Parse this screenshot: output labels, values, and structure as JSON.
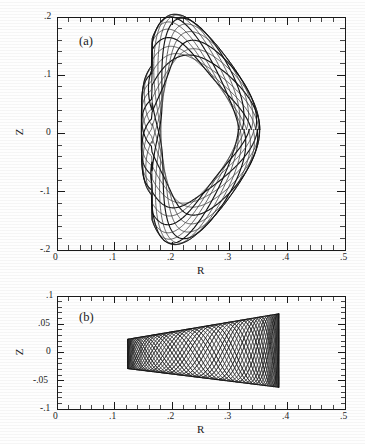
{
  "figure": {
    "type": "scientific-figure",
    "background_color": "#fefefe",
    "line_color": "#1a1a1a"
  },
  "panels": [
    {
      "tag": "(a)",
      "xlabel": "R",
      "ylabel": "Z",
      "xlim": [
        0,
        0.5
      ],
      "ylim": [
        -0.2,
        0.2
      ],
      "xticks": [
        "0",
        ".1",
        ".2",
        ".3",
        ".4",
        ".5"
      ],
      "xtick_values": [
        0,
        0.1,
        0.2,
        0.3,
        0.4,
        0.5
      ],
      "yticks": [
        ".2",
        ".1",
        "0",
        "-.1",
        "-.2"
      ],
      "ytick_values": [
        0.2,
        0.1,
        0,
        -0.1,
        -0.2
      ],
      "xminor_per_major": 5,
      "yminor_per_major": 5,
      "grid": false
    },
    {
      "tag": "(b)",
      "xlabel": "R",
      "ylabel": "Z",
      "xlim": [
        0,
        0.5
      ],
      "ylim": [
        -0.1,
        0.1
      ],
      "xticks": [
        "0",
        ".1",
        ".2",
        ".3",
        ".4",
        ".5"
      ],
      "xtick_values": [
        0,
        0.1,
        0.2,
        0.3,
        0.4,
        0.5
      ],
      "yticks": [
        ".1",
        ".05",
        "0",
        "-.05",
        "-.1"
      ],
      "ytick_values": [
        0.1,
        0.05,
        0,
        -0.05,
        -0.1
      ],
      "xminor_per_major": 5,
      "yminor_per_major": 5,
      "grid": false
    }
  ],
  "chart_data": {
    "type": "line",
    "title": "",
    "xlabel": "R",
    "ylabel": "Z",
    "subplots": [
      {
        "tag": "(a)",
        "xlim": [
          0,
          0.5
        ],
        "ylim": [
          -0.2,
          0.2
        ],
        "xlabel": "R",
        "ylabel": "Z",
        "xticks": [
          0,
          0.1,
          0.2,
          0.3,
          0.4,
          0.5
        ],
        "xticklabels": [
          "0",
          ".1",
          ".2",
          ".3",
          ".4",
          ".5"
        ],
        "yticks": [
          -0.2,
          -0.1,
          0,
          0.1,
          0.2
        ],
        "yticklabels": [
          "-.2",
          "-.1",
          "0",
          ".1",
          ".2"
        ],
        "surface": {
          "shape": "bean-triangular flux surface traced by helical field lines",
          "R_min": 0.143,
          "R_max": 0.352,
          "Z_min": -0.163,
          "Z_max": 0.178,
          "R_center": 0.248,
          "Z_center": 0.007,
          "n_field_line_traces": 14,
          "boundary_R": [
            0.143,
            0.15,
            0.175,
            0.215,
            0.262,
            0.3,
            0.33,
            0.348,
            0.352,
            0.345,
            0.328,
            0.305,
            0.282,
            0.255,
            0.222,
            0.188,
            0.16,
            0.145,
            0.143
          ],
          "boundary_Z": [
            0.098,
            0.135,
            0.163,
            0.176,
            0.172,
            0.152,
            0.118,
            0.07,
            0.01,
            -0.05,
            -0.1,
            -0.14,
            -0.16,
            -0.163,
            -0.148,
            -0.122,
            -0.1,
            -0.094,
            0.098
          ],
          "inner_indent_R": 0.143,
          "inner_indent_Z_range": [
            -0.094,
            0.098
          ]
        }
      },
      {
        "tag": "(b)",
        "xlim": [
          0,
          0.5
        ],
        "ylim": [
          -0.1,
          0.1
        ],
        "xlabel": "R",
        "ylabel": "Z",
        "xticks": [
          0,
          0.1,
          0.2,
          0.3,
          0.4,
          0.5
        ],
        "xticklabels": [
          "0",
          ".1",
          ".2",
          ".3",
          ".4",
          ".5"
        ],
        "yticks": [
          -0.1,
          -0.05,
          0,
          0.05,
          0.1
        ],
        "yticklabels": [
          "-.1",
          "-.05",
          "0",
          ".05",
          "-.1"
        ],
        "surface": {
          "shape": "flattened wedge flux surface widening with R, traced by helical field lines",
          "R_min": 0.123,
          "R_max": 0.385,
          "Z_min": -0.062,
          "Z_max": 0.069,
          "half_width_at_Rmin": 0.026,
          "half_width_at_Rmax": 0.065,
          "n_field_line_traces": 22,
          "upper_edge_R": [
            0.123,
            0.175,
            0.23,
            0.29,
            0.34,
            0.385
          ],
          "upper_edge_Z": [
            0.024,
            0.033,
            0.043,
            0.054,
            0.062,
            0.069
          ],
          "lower_edge_R": [
            0.123,
            0.175,
            0.23,
            0.29,
            0.34,
            0.385
          ],
          "lower_edge_Z": [
            -0.029,
            -0.034,
            -0.041,
            -0.05,
            -0.057,
            -0.062
          ]
        }
      }
    ]
  }
}
